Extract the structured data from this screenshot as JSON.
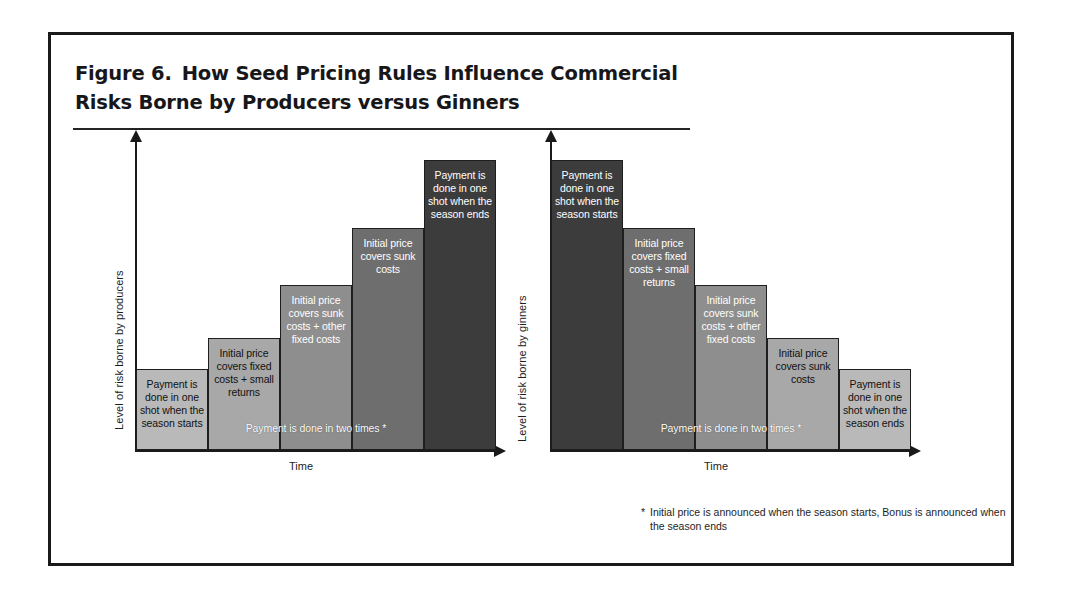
{
  "figure": {
    "label": "Figure 6.",
    "title": "How Seed Pricing Rules Influence Commercial Risks Borne by Producers versus Ginners",
    "footnote_mark": "*",
    "footnote_text": "Initial price is announced when the season starts, Bonus is announced when the season ends"
  },
  "chart_data": [
    {
      "type": "bar",
      "id": "producers",
      "title": "",
      "xlabel": "Time",
      "ylabel": "Level of risk borne by producers",
      "grid": false,
      "legend": "none",
      "ylim": [
        0,
        100
      ],
      "overlay_note": "Payment is done in two times *",
      "categories": [
        "1",
        "2",
        "3",
        "4",
        "5"
      ],
      "values": [
        26,
        36,
        53,
        71,
        93
      ],
      "bar_labels": [
        "Payment is done in one shot when the season starts",
        "Initial price covers fixed costs + small returns",
        "Initial price covers sunk costs + other fixed costs",
        "Initial price covers sunk costs",
        "Payment is done in one shot when the season ends"
      ],
      "bar_colors": [
        "#b9b9b9",
        "#a8a8a8",
        "#8e8e8e",
        "#6e6e6e",
        "#3c3c3c"
      ],
      "bar_text_colors": [
        "dark",
        "dark",
        "light",
        "light",
        "light"
      ]
    },
    {
      "type": "bar",
      "id": "ginners",
      "title": "",
      "xlabel": "Time",
      "ylabel": "Level of risk borne by ginners",
      "grid": false,
      "legend": "none",
      "ylim": [
        0,
        100
      ],
      "overlay_note": "Payment is done in two times *",
      "categories": [
        "1",
        "2",
        "3",
        "4",
        "5"
      ],
      "values": [
        93,
        71,
        53,
        36,
        26
      ],
      "bar_labels": [
        "Payment is done in one shot when the season starts",
        "Initial price covers fixed costs + small returns",
        "Initial price covers sunk costs + other fixed costs",
        "Initial price covers sunk costs",
        "Payment is done in one shot when the season ends"
      ],
      "bar_colors": [
        "#3c3c3c",
        "#6e6e6e",
        "#8e8e8e",
        "#a8a8a8",
        "#b9b9b9"
      ],
      "bar_text_colors": [
        "light",
        "light",
        "light",
        "dark",
        "dark"
      ]
    }
  ]
}
